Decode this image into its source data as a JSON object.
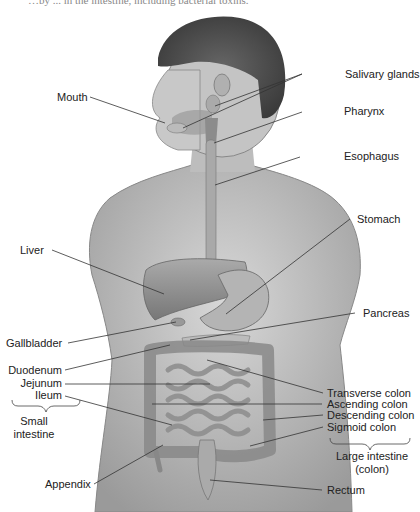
{
  "figure": {
    "clipped_caption": "…by ... in the intestine, including bacterial toxins.",
    "labels_left": {
      "mouth": "Mouth",
      "liver": "Liver",
      "gallbladder": "Gallbladder",
      "duodenum": "Duodenum",
      "jejunum": "Jejunum",
      "ileum": "Ileum",
      "small_intestine_line1": "Small",
      "small_intestine_line2": "intestine",
      "appendix": "Appendix"
    },
    "labels_right": {
      "salivary_glands": "Salivary glands",
      "pharynx": "Pharynx",
      "esophagus": "Esophagus",
      "stomach": "Stomach",
      "pancreas": "Pancreas",
      "transverse_colon": "Transverse colon",
      "ascending_colon": "Ascending colon",
      "descending_colon": "Descending colon",
      "sigmoid_colon": "Sigmoid colon",
      "large_intestine_line1": "Large intestine",
      "large_intestine_line2": "(colon)",
      "rectum": "Rectum"
    }
  }
}
